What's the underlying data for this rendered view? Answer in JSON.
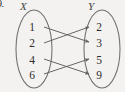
{
  "figure": {
    "problem_number": "9.",
    "caption": "Mapping diagram of a relation from set X to set Y",
    "background_color": "#f3f2f0",
    "stroke_color": "#6b6b6b",
    "text_color": "#2e2e2e"
  },
  "sets": {
    "domain": {
      "label": "X",
      "label_name": "set-x-label",
      "elements": [
        {
          "value": "1",
          "x": 32,
          "y": 22
        },
        {
          "value": "2",
          "x": 32,
          "y": 38
        },
        {
          "value": "4",
          "x": 32,
          "y": 55
        },
        {
          "value": "6",
          "x": 32,
          "y": 70
        }
      ],
      "oval": {
        "cx": 34,
        "cy": 49,
        "rx": 18,
        "ry": 39
      }
    },
    "codomain": {
      "label": "Y",
      "label_name": "set-y-label",
      "elements": [
        {
          "value": "2",
          "x": 99,
          "y": 22
        },
        {
          "value": "3",
          "x": 99,
          "y": 38
        },
        {
          "value": "5",
          "x": 99,
          "y": 55
        },
        {
          "value": "9",
          "x": 99,
          "y": 70
        }
      ],
      "oval": {
        "cx": 102,
        "cy": 49,
        "rx": 18,
        "ry": 39
      }
    }
  },
  "mappings": [
    {
      "from": "1",
      "to": "3",
      "x1": 44,
      "y1": 27,
      "x2": 89,
      "y2": 42
    },
    {
      "from": "2",
      "to": "2",
      "x1": 44,
      "y1": 43,
      "x2": 89,
      "y2": 27
    },
    {
      "from": "4",
      "to": "9",
      "x1": 44,
      "y1": 59,
      "x2": 89,
      "y2": 74
    },
    {
      "from": "6",
      "to": "5",
      "x1": 44,
      "y1": 74,
      "x2": 89,
      "y2": 59
    }
  ],
  "chart_data": {
    "type": "diagram",
    "domain_label": "X",
    "codomain_label": "Y",
    "domain_values": [
      "1",
      "2",
      "4",
      "6"
    ],
    "codomain_values": [
      "2",
      "3",
      "5",
      "9"
    ],
    "pairs": [
      [
        "1",
        "3"
      ],
      [
        "2",
        "2"
      ],
      [
        "4",
        "9"
      ],
      [
        "6",
        "5"
      ]
    ]
  }
}
